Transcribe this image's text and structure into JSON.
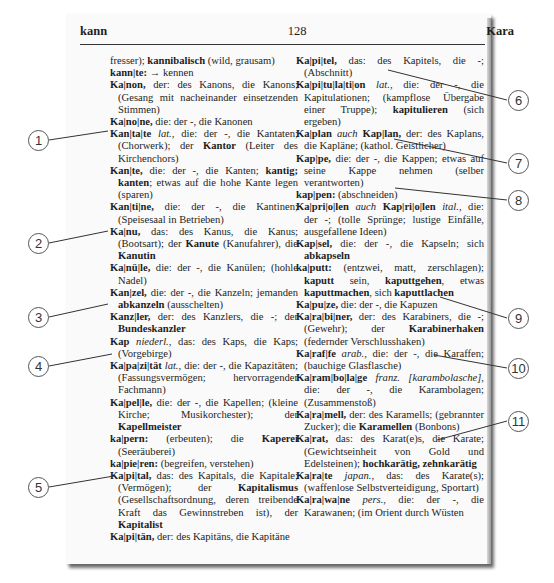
{
  "header": {
    "left_guide_word": "kann",
    "page_number": "128",
    "right_guide_word": "Kara"
  },
  "left_column": [
    [
      {
        "t": "fresser); "
      },
      {
        "t": "kannibalisch",
        "s": "b"
      },
      {
        "t": " (wild, grausam)"
      }
    ],
    [
      {
        "t": "kann|te:",
        "s": "b"
      },
      {
        "t": " → kennen"
      }
    ],
    [
      {
        "t": "Ka|non,",
        "s": "b"
      },
      {
        "t": " der: des Kanons, die Kanons; (Gesang mit nacheinander einsetzenden Stimmen)"
      }
    ],
    [
      {
        "t": "Ka|no|ne,",
        "s": "b"
      },
      {
        "t": " die: der -, die Kanonen"
      }
    ],
    [
      {
        "t": "Kan|ta|te",
        "s": "b"
      },
      {
        "t": " "
      },
      {
        "t": "lat.",
        "s": "i"
      },
      {
        "t": ", die: der -, die Kantaten; (Chorwerk); der "
      },
      {
        "t": "Kantor",
        "s": "b"
      },
      {
        "t": " (Leiter des Kirchenchors)"
      }
    ],
    [
      {
        "t": "Kan|te,",
        "s": "b"
      },
      {
        "t": " die: der -, die Kanten; "
      },
      {
        "t": "kantig; kanten",
        "s": "b"
      },
      {
        "t": "; etwas auf die hohe Kante legen (sparen)"
      }
    ],
    [
      {
        "t": "Kan|ti|ne,",
        "s": "b"
      },
      {
        "t": " die: der -, die Kantinen; (Speisesaal in Betrieben)"
      }
    ],
    [
      {
        "t": "Ka|nu,",
        "s": "b"
      },
      {
        "t": " das: des Kanus, die Kanus; (Bootsart); der "
      },
      {
        "t": "Kanute",
        "s": "b"
      },
      {
        "t": " (Kanufahrer), die "
      },
      {
        "t": "Kanutin",
        "s": "b"
      }
    ],
    [
      {
        "t": "Ka|nü|le,",
        "s": "b"
      },
      {
        "t": " die: der -, die Kanülen; (hohle Nadel)"
      }
    ],
    [
      {
        "t": "Kan|zel,",
        "s": "b"
      },
      {
        "t": " die: der -, die Kanzeln; jemanden "
      },
      {
        "t": "abkanzeln",
        "s": "b"
      },
      {
        "t": " (ausschelten)"
      }
    ],
    [
      {
        "t": "Kanz|ler,",
        "s": "b"
      },
      {
        "t": " der: des Kanzlers, die -; der "
      },
      {
        "t": "Bundeskanzler",
        "s": "b"
      }
    ],
    [
      {
        "t": "Kap",
        "s": "b"
      },
      {
        "t": " "
      },
      {
        "t": "niederl.",
        "s": "i"
      },
      {
        "t": ", das: des Kaps, die Kaps; (Vorgebirge)"
      }
    ],
    [
      {
        "t": "Ka|pa|zi|tät",
        "s": "b"
      },
      {
        "t": " "
      },
      {
        "t": "lat.",
        "s": "i"
      },
      {
        "t": ", die: der -, die Kapazitäten; (Fassungsvermögen; hervorragender Fachmann)"
      }
    ],
    [
      {
        "t": "Ka|pel|le,",
        "s": "b"
      },
      {
        "t": " die: der -, die Kapellen; (kleine Kirche; Musikorchester); der "
      },
      {
        "t": "Kapellmeister",
        "s": "b"
      }
    ],
    [
      {
        "t": "ka|pern:",
        "s": "b"
      },
      {
        "t": " (erbeuten); die "
      },
      {
        "t": "Kaperei",
        "s": "b"
      },
      {
        "t": " (Seeräuberei)"
      }
    ],
    [
      {
        "t": "ka|pie|ren:",
        "s": "b"
      },
      {
        "t": " (begreifen, verstehen)"
      }
    ],
    [
      {
        "t": "Ka|pi|tal,",
        "s": "b"
      },
      {
        "t": " das: des Kapitals, die Kapitale; (Vermögen); der "
      },
      {
        "t": "Kapitalismus",
        "s": "b"
      },
      {
        "t": " (Gesellschaftsordnung, deren treibende Kraft das Gewinnstreben ist), der "
      },
      {
        "t": "Kapitalist",
        "s": "b"
      }
    ],
    [
      {
        "t": "Ka|pi|tän,",
        "s": "b"
      },
      {
        "t": " der: des Kapitäns, die Kapitäne"
      }
    ]
  ],
  "right_column": [
    [
      {
        "t": "Ka|pi|tel,",
        "s": "b"
      },
      {
        "t": " das: des Kapitels, die -; (Abschnitt)"
      }
    ],
    [
      {
        "t": "Ka|pi|tu|la|ti|on",
        "s": "b"
      },
      {
        "t": " "
      },
      {
        "t": "lat.",
        "s": "i"
      },
      {
        "t": ", die: der -, die Kapitulationen; (kampflose Übergabe einer Truppe); "
      },
      {
        "t": "kapitulieren",
        "s": "b"
      },
      {
        "t": " (sich ergeben)"
      }
    ],
    [
      {
        "t": "Ka|plan",
        "s": "b"
      },
      {
        "t": " "
      },
      {
        "t": "auch",
        "s": "i"
      },
      {
        "t": " "
      },
      {
        "t": "Kap|lan,",
        "s": "b"
      },
      {
        "t": " der: des Kaplans, die Kapläne; (kathol. Geistlicher)"
      }
    ],
    [
      {
        "t": "Kap|pe,",
        "s": "b"
      },
      {
        "t": " die: der -, die Kappen; etwas auf seine Kappe nehmen (selber verantworten)"
      }
    ],
    [
      {
        "t": "kap|pen:",
        "s": "b"
      },
      {
        "t": " (abschneiden)"
      }
    ],
    [
      {
        "t": "Ka|pri|o|len",
        "s": "b"
      },
      {
        "t": " "
      },
      {
        "t": "auch",
        "s": "i"
      },
      {
        "t": " "
      },
      {
        "t": "Kap|ri|o|len",
        "s": "b"
      },
      {
        "t": " "
      },
      {
        "t": "ital.",
        "s": "i"
      },
      {
        "t": ", die: der -; (tolle Sprünge; lustige Einfälle, ausgefallene Ideen)"
      }
    ],
    [
      {
        "t": "Kap|sel,",
        "s": "b"
      },
      {
        "t": " die: der -, die Kapseln; sich "
      },
      {
        "t": "abkapseln",
        "s": "b"
      }
    ],
    [
      {
        "t": "ka|putt:",
        "s": "b"
      },
      {
        "t": " (entzwei, matt, zerschlagen); "
      },
      {
        "t": "kaputt",
        "s": "b"
      },
      {
        "t": " sein, "
      },
      {
        "t": "kaputtgehen",
        "s": "b"
      },
      {
        "t": ", etwas "
      },
      {
        "t": "kaputtmachen",
        "s": "b"
      },
      {
        "t": ", sich "
      },
      {
        "t": "kaputtlachen",
        "s": "b"
      }
    ],
    [
      {
        "t": "Ka|pu|ze,",
        "s": "b"
      },
      {
        "t": " die: der -, die Kapuzen"
      }
    ],
    [
      {
        "t": "Ka|ra|bi|ner,",
        "s": "b"
      },
      {
        "t": " der: des Karabiners, die -; (Gewehr); der "
      },
      {
        "t": "Karabinerhaken",
        "s": "b"
      },
      {
        "t": " (federnder Verschlusshaken)"
      }
    ],
    [
      {
        "t": "Ka|raf|fe",
        "s": "b"
      },
      {
        "t": " "
      },
      {
        "t": "arab.",
        "s": "i"
      },
      {
        "t": ", die: der -, die Karaffen; (bauchige Glasflasche)"
      }
    ],
    [
      {
        "t": "Ka|ram|bo|la|ge",
        "s": "b"
      },
      {
        "t": " "
      },
      {
        "t": "franz. [karambolasche]",
        "s": "i"
      },
      {
        "t": ", die: der -, die Karambolagen; (Zusammenstoß)"
      }
    ],
    [
      {
        "t": "Ka|ra|mell,",
        "s": "b"
      },
      {
        "t": " der: des Karamells; (gebrannter Zucker); die "
      },
      {
        "t": "Karamellen",
        "s": "b"
      },
      {
        "t": " (Bonbons)"
      }
    ],
    [
      {
        "t": "Ka|rat,",
        "s": "b"
      },
      {
        "t": " das: des Karat(e)s, die Karate; (Gewichtseinheit von Gold und Edelsteinen); "
      },
      {
        "t": "hochkarätig, zehnkarätig",
        "s": "b"
      }
    ],
    [
      {
        "t": "Ka|ra|te",
        "s": "b"
      },
      {
        "t": " "
      },
      {
        "t": "japan.",
        "s": "i"
      },
      {
        "t": ", das: des Karate(s); (waffenlose Selbstverteidigung, Sportart)"
      }
    ],
    [
      {
        "t": "Ka|ra|wa|ne",
        "s": "b"
      },
      {
        "t": " "
      },
      {
        "t": "pers.",
        "s": "i"
      },
      {
        "t": ", die: der -, die Karawanen; (im Orient durch Wüsten"
      }
    ]
  ],
  "callouts": [
    {
      "n": "1",
      "cx": 38,
      "cy": 140,
      "tx": 108,
      "ty": 131
    },
    {
      "n": "2",
      "cx": 38,
      "cy": 243,
      "tx": 108,
      "ty": 231
    },
    {
      "n": "3",
      "cx": 38,
      "cy": 317,
      "tx": 108,
      "ty": 304
    },
    {
      "n": "4",
      "cx": 38,
      "cy": 366,
      "tx": 112,
      "ty": 354
    },
    {
      "n": "5",
      "cx": 38,
      "cy": 487,
      "tx": 114,
      "ty": 476
    },
    {
      "n": "6",
      "cx": 518,
      "cy": 100,
      "tx": 388,
      "ty": 70
    },
    {
      "n": "7",
      "cx": 518,
      "cy": 163,
      "tx": 394,
      "ty": 139
    },
    {
      "n": "8",
      "cx": 518,
      "cy": 200,
      "tx": 395,
      "ty": 188
    },
    {
      "n": "9",
      "cx": 518,
      "cy": 318,
      "tx": 440,
      "ty": 297
    },
    {
      "n": "10",
      "cx": 518,
      "cy": 368,
      "tx": 434,
      "ty": 355
    },
    {
      "n": "11",
      "cx": 518,
      "cy": 421,
      "tx": 437,
      "ty": 440
    }
  ]
}
